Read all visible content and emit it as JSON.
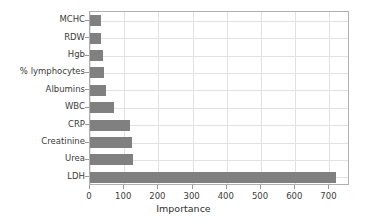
{
  "chart_data": {
    "type": "bar",
    "orientation": "horizontal",
    "title": "",
    "xlabel": "Importance",
    "ylabel": "",
    "categories": [
      "LDH",
      "Urea",
      "Creatinine",
      "CRP",
      "WBC",
      "Albumins",
      "% lymphocytes",
      "Hgb",
      "RDW",
      "MCHC"
    ],
    "values": [
      718,
      127,
      122,
      117,
      71,
      48,
      42,
      38,
      33,
      31
    ],
    "xlim": [
      0,
      760
    ],
    "ylim": [
      -0.5,
      9.5
    ],
    "xticks": [
      0,
      100,
      200,
      300,
      400,
      500,
      600,
      700
    ],
    "xticklabels": [
      "0",
      "100",
      "200",
      "300",
      "400",
      "500",
      "600",
      "700"
    ],
    "grid": true,
    "grid_axis": "both",
    "legend": false,
    "bar_color": "#808080",
    "grid_color": "#e2e2e2",
    "frame_color": "#b0b0b0",
    "text_color": "#3b3b3b"
  }
}
